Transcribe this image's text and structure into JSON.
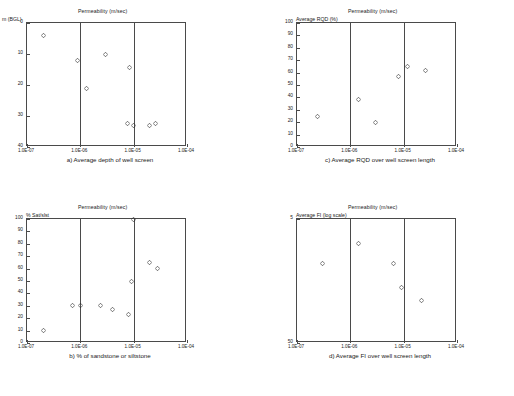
{
  "figure": {
    "background": "#ffffff",
    "marker_color": "#2b2b2b",
    "axis_color": "#4a4a4a",
    "marker_symbol": "diamond-open"
  },
  "panels": [
    {
      "id": "a",
      "caption": "a)  Average depth of well screen",
      "title": "Permeability (m/sec)",
      "ylabel": "m (BGL)",
      "xticklabels": [
        "1.0E-07",
        "1.0E-06",
        "1.0E-05",
        "1.0E-04"
      ],
      "yticklabels": [
        "0",
        "10",
        "20",
        "30",
        "40"
      ]
    },
    {
      "id": "b",
      "caption": "b)  % of sandstone or siltstone",
      "title": "Permeability (m/sec)",
      "ylabel": "% Sat/slst",
      "xticklabels": [
        "1.0E-07",
        "1.0E-06",
        "1.0E-05",
        "1.0E-04"
      ],
      "yticklabels": [
        "0",
        "10",
        "20",
        "30",
        "40",
        "50",
        "60",
        "70",
        "80",
        "90",
        "100"
      ]
    },
    {
      "id": "c",
      "caption": "c)  Average RQD over well screen length",
      "title": "Permeability (m/sec)",
      "ylabel": "Average RQD (%)",
      "xticklabels": [
        "1.0E-07",
        "1.0E-06",
        "1.0E-05",
        "1.0E-04"
      ],
      "yticklabels": [
        "0",
        "10",
        "20",
        "30",
        "40",
        "50",
        "60",
        "70",
        "80",
        "90",
        "100"
      ]
    },
    {
      "id": "d",
      "caption": "d)  Average FI over well screen length",
      "title": "Permeability (m/sec)",
      "ylabel": "Average FI (log scale)",
      "xticklabels": [
        "1.0E-07",
        "1.0E-06",
        "1.0E-05",
        "1.0E-04"
      ],
      "yticklabels": [
        "50",
        "5"
      ]
    }
  ],
  "chart_data": [
    {
      "type": "scatter",
      "id": "a",
      "title": "Permeability (m/sec)",
      "caption": "a)  Average depth of well screen",
      "xlabel": "Permeability (m/sec)",
      "ylabel": "m (BGL)",
      "xscale": "log",
      "xlim": [
        1e-07,
        0.0001
      ],
      "ylim": [
        0,
        40
      ],
      "y_inverted": true,
      "xticks": [
        1e-07,
        1e-06,
        1e-05,
        0.0001
      ],
      "yticks": [
        0,
        10,
        20,
        30,
        40
      ],
      "grid": false,
      "points": [
        {
          "x": 2e-07,
          "y": 4.0
        },
        {
          "x": 9e-07,
          "y": 12.0
        },
        {
          "x": 1.3e-06,
          "y": 21.0
        },
        {
          "x": 3e-06,
          "y": 10.0
        },
        {
          "x": 8.5e-06,
          "y": 14.5
        },
        {
          "x": 7.5e-06,
          "y": 32.5
        },
        {
          "x": 1e-05,
          "y": 33.0
        },
        {
          "x": 2e-05,
          "y": 33.0
        },
        {
          "x": 2.6e-05,
          "y": 32.5
        }
      ]
    },
    {
      "type": "scatter",
      "id": "b",
      "title": "Permeability (m/sec)",
      "caption": "b)  % of sandstone or siltstone",
      "xlabel": "Permeability (m/sec)",
      "ylabel": "% Sat/slst",
      "xscale": "log",
      "xlim": [
        1e-07,
        0.0001
      ],
      "ylim": [
        0,
        100
      ],
      "y_inverted": false,
      "xticks": [
        1e-07,
        1e-06,
        1e-05,
        0.0001
      ],
      "yticks": [
        0,
        10,
        20,
        30,
        40,
        50,
        60,
        70,
        80,
        90,
        100
      ],
      "grid": false,
      "points": [
        {
          "x": 2e-07,
          "y": 10.0
        },
        {
          "x": 7e-07,
          "y": 30.0
        },
        {
          "x": 1e-06,
          "y": 30.0
        },
        {
          "x": 2.4e-06,
          "y": 30.0
        },
        {
          "x": 4e-06,
          "y": 27.0
        },
        {
          "x": 8e-06,
          "y": 23.0
        },
        {
          "x": 9e-06,
          "y": 50.0
        },
        {
          "x": 1e-05,
          "y": 100.0
        },
        {
          "x": 2e-05,
          "y": 65.0
        },
        {
          "x": 2.8e-05,
          "y": 60.0
        }
      ]
    },
    {
      "type": "scatter",
      "id": "c",
      "title": "Permeability (m/sec)",
      "caption": "c)  Average RQD over well screen length",
      "xlabel": "Permeability (m/sec)",
      "ylabel": "Average RQD (%)",
      "xscale": "log",
      "xlim": [
        1e-07,
        0.0001
      ],
      "ylim": [
        0,
        100
      ],
      "y_inverted": false,
      "xticks": [
        1e-07,
        1e-06,
        1e-05,
        0.0001
      ],
      "yticks": [
        0,
        10,
        20,
        30,
        40,
        50,
        60,
        70,
        80,
        90,
        100
      ],
      "grid": false,
      "points": [
        {
          "x": 2.4e-07,
          "y": 25.0
        },
        {
          "x": 1.4e-06,
          "y": 38.0
        },
        {
          "x": 3e-06,
          "y": 20.0
        },
        {
          "x": 8e-06,
          "y": 57.0
        },
        {
          "x": 1.2e-05,
          "y": 65.0
        },
        {
          "x": 2.6e-05,
          "y": 62.0
        }
      ]
    },
    {
      "type": "scatter",
      "id": "d",
      "title": "Permeability (m/sec)",
      "caption": "d)  Average FI over well screen length",
      "xlabel": "Permeability (m/sec)",
      "ylabel": "Average FI (log scale)",
      "xscale": "log",
      "xlim": [
        1e-07,
        0.0001
      ],
      "ylim": [
        5,
        50
      ],
      "yscale": "log",
      "y_inverted": false,
      "xticks": [
        1e-07,
        1e-06,
        1e-05,
        0.0001
      ],
      "yticks": [
        5,
        50
      ],
      "grid": false,
      "points": [
        {
          "x": 3e-07,
          "y": 22.0
        },
        {
          "x": 1.4e-06,
          "y": 32.0
        },
        {
          "x": 6.5e-06,
          "y": 22.0
        },
        {
          "x": 9e-06,
          "y": 14.0
        },
        {
          "x": 2.2e-05,
          "y": 11.0
        }
      ]
    }
  ]
}
